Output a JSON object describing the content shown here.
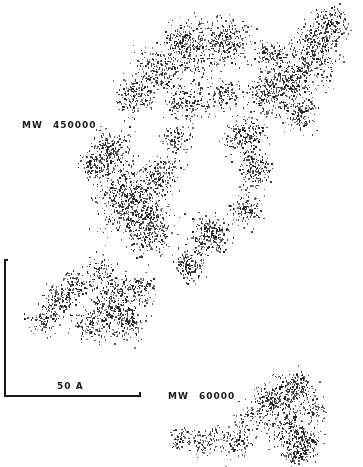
{
  "figure": {
    "labels": {
      "chain_large": {
        "prefix": "MW",
        "value": "450000"
      },
      "chain_small": {
        "prefix": "MW",
        "value": "60000"
      }
    },
    "scale_bar": {
      "label": "50 A",
      "length_px": 135
    },
    "ink_color": "#1a1a1a",
    "background": "#ffffff",
    "clouds": {
      "chain_large": [
        [
          195,
          45,
          18,
          260
        ],
        [
          230,
          40,
          14,
          200
        ],
        [
          160,
          70,
          16,
          220
        ],
        [
          190,
          100,
          14,
          160
        ],
        [
          135,
          95,
          12,
          160
        ],
        [
          110,
          150,
          14,
          200
        ],
        [
          130,
          200,
          22,
          520
        ],
        [
          150,
          230,
          16,
          260
        ],
        [
          95,
          165,
          10,
          120
        ],
        [
          160,
          175,
          12,
          140
        ],
        [
          210,
          235,
          14,
          220
        ],
        [
          190,
          265,
          10,
          140
        ],
        [
          245,
          135,
          14,
          200
        ],
        [
          255,
          170,
          12,
          160
        ],
        [
          245,
          210,
          10,
          120
        ],
        [
          290,
          80,
          20,
          380
        ],
        [
          315,
          50,
          16,
          260
        ],
        [
          330,
          25,
          12,
          160
        ],
        [
          265,
          95,
          12,
          140
        ],
        [
          300,
          115,
          10,
          120
        ],
        [
          270,
          55,
          10,
          90
        ],
        [
          225,
          95,
          10,
          90
        ],
        [
          175,
          140,
          10,
          90
        ],
        [
          180,
          40,
          10,
          90
        ],
        [
          60,
          300,
          12,
          140
        ],
        [
          75,
          285,
          10,
          90
        ],
        [
          110,
          300,
          16,
          240
        ],
        [
          125,
          320,
          12,
          160
        ],
        [
          90,
          325,
          12,
          120
        ],
        [
          45,
          320,
          10,
          90
        ],
        [
          140,
          290,
          10,
          90
        ],
        [
          100,
          270,
          10,
          70
        ]
      ],
      "chain_small": [
        [
          285,
          395,
          14,
          160
        ],
        [
          300,
          385,
          10,
          90
        ],
        [
          268,
          400,
          10,
          100
        ],
        [
          255,
          415,
          12,
          80
        ],
        [
          290,
          430,
          14,
          180
        ],
        [
          305,
          445,
          10,
          110
        ],
        [
          295,
          455,
          8,
          70
        ],
        [
          235,
          440,
          12,
          110
        ],
        [
          205,
          440,
          10,
          80
        ],
        [
          180,
          438,
          8,
          60
        ],
        [
          315,
          410,
          8,
          60
        ]
      ]
    }
  }
}
